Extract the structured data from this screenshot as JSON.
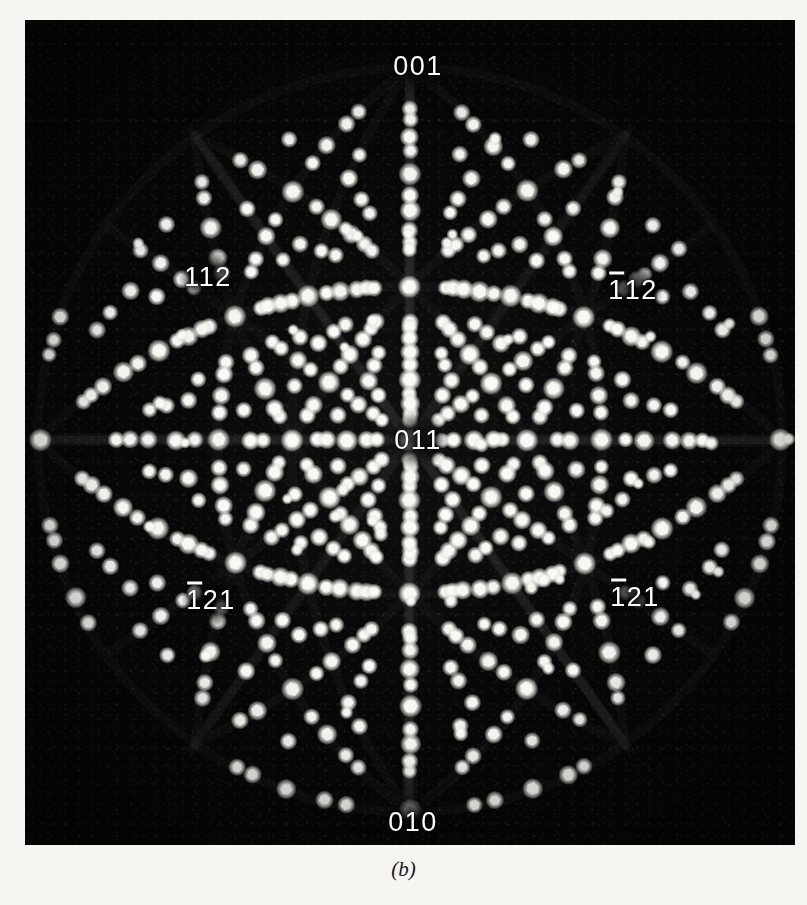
{
  "figure": {
    "caption": "(b)",
    "type": "laue-diffraction-photograph",
    "plate": {
      "background_color": "#070707",
      "spot_color": "#f2f2ee",
      "page_background": "#f6f5f2",
      "left": 25,
      "top": 20,
      "width": 770,
      "height": 825
    }
  },
  "pole_labels": [
    {
      "id": "pole-001",
      "text": "001",
      "overbar_index": -1,
      "x": 418,
      "y": 66,
      "note": "top pole"
    },
    {
      "id": "pole-112",
      "text": "112",
      "overbar_index": -1,
      "x": 208,
      "y": 277,
      "note": "upper left pole"
    },
    {
      "id": "pole-1bar12",
      "text": "112",
      "overbar_index": 0,
      "x": 633,
      "y": 290,
      "note": "upper right pole, bar over first index"
    },
    {
      "id": "pole-011",
      "text": "011",
      "overbar_index": -1,
      "x": 418,
      "y": 440,
      "note": "centre pole"
    },
    {
      "id": "pole-1bar21-l",
      "text": "121",
      "overbar_index": 0,
      "x": 211,
      "y": 600,
      "note": "lower left pole, bar over first index"
    },
    {
      "id": "pole-1bar21-r",
      "text": "121",
      "overbar_index": 0,
      "x": 635,
      "y": 597,
      "note": "lower right pole, bar over first index"
    },
    {
      "id": "pole-010",
      "text": "010",
      "overbar_index": -1,
      "x": 413,
      "y": 822,
      "note": "bottom pole"
    }
  ],
  "chart_data": {
    "type": "scatter",
    "title": "",
    "xlabel": "",
    "ylabel": "",
    "projection": "stereographic",
    "centre_pole": "011",
    "symmetry": "2mm (about 011 centre)",
    "grid": false,
    "legend": false,
    "spot_count_approx": 900,
    "spot_radius_px": [
      4,
      8
    ],
    "envelope": {
      "shape": "rounded-heart / circular with notched corners",
      "centre_x": 410,
      "centre_y": 440,
      "radius_px": 372
    },
    "labelled_poles": [
      "001",
      "112",
      "-112",
      "011",
      "-121",
      "-121",
      "010"
    ]
  }
}
